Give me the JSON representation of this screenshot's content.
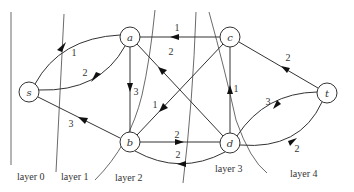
{
  "diagram": {
    "nodes": [
      {
        "id": "s",
        "label": "s",
        "x": 29,
        "y": 92
      },
      {
        "id": "a",
        "label": "a",
        "x": 130,
        "y": 37
      },
      {
        "id": "b",
        "label": "b",
        "x": 130,
        "y": 142
      },
      {
        "id": "c",
        "label": "c",
        "x": 230,
        "y": 37
      },
      {
        "id": "d",
        "label": "d",
        "x": 230,
        "y": 143
      },
      {
        "id": "t",
        "label": "t",
        "x": 327,
        "y": 93
      }
    ],
    "edges": [
      {
        "from": "s",
        "to": "a",
        "weight": "1",
        "curve": "upper"
      },
      {
        "from": "a",
        "to": "s",
        "weight": "2",
        "curve": "lower"
      },
      {
        "from": "b",
        "to": "s",
        "weight": "3"
      },
      {
        "from": "a",
        "to": "b",
        "weight": "3"
      },
      {
        "from": "c",
        "to": "a",
        "weight": "1"
      },
      {
        "from": "d",
        "to": "a",
        "weight": "2"
      },
      {
        "from": "c",
        "to": "b",
        "weight": "1"
      },
      {
        "from": "b",
        "to": "d",
        "weight": "2"
      },
      {
        "from": "d",
        "to": "b",
        "weight": "2",
        "curve": "lower"
      },
      {
        "from": "d",
        "to": "c",
        "weight": "1"
      },
      {
        "from": "t",
        "to": "c",
        "weight": "2"
      },
      {
        "from": "t",
        "to": "d",
        "weight": "3",
        "curve": "upper"
      },
      {
        "from": "d",
        "to": "t",
        "weight": "2",
        "curve": "lower"
      }
    ],
    "layers": [
      {
        "label": "layer 0"
      },
      {
        "label": "layer 1"
      },
      {
        "label": "layer 2"
      },
      {
        "label": "layer 3"
      },
      {
        "label": "layer 4"
      }
    ]
  }
}
